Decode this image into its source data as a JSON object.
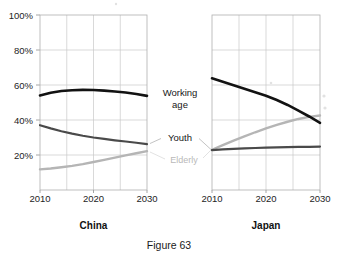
{
  "caption": "Figure 63",
  "axis": {
    "y_ticks": [
      "100%",
      "80%",
      "60%",
      "40%",
      "20%"
    ],
    "y_tick_values": [
      100,
      80,
      60,
      40,
      20
    ],
    "x_ticks": [
      "2010",
      "2020",
      "2030"
    ],
    "x_tick_values": [
      2010,
      2020,
      2030
    ]
  },
  "annotations": {
    "working_age": "Working age",
    "working_age_line1": "Working",
    "working_age_line2": "age",
    "youth": "Youth",
    "elderly": "Elderly"
  },
  "panels": {
    "left": {
      "title": "China"
    },
    "right": {
      "title": "Japan"
    }
  },
  "colors": {
    "working_age": "#121212",
    "youth": "#4a4a4a",
    "elderly": "#b5b5b5",
    "grid": "#c9c9c9",
    "frame": "#b0b0b0",
    "background": "#ffffff"
  },
  "chart_data": [
    {
      "type": "line",
      "title": "China",
      "xlabel": "",
      "ylabel": "",
      "xlim": [
        2010,
        2030
      ],
      "ylim": [
        0,
        100
      ],
      "grid": true,
      "legend": "inline-annotations",
      "x": [
        2010,
        2012,
        2014,
        2016,
        2018,
        2020,
        2022,
        2024,
        2026,
        2028,
        2030
      ],
      "series": [
        {
          "name": "Working age",
          "values": [
            54.0,
            55.6,
            56.6,
            57.0,
            57.2,
            57.1,
            56.8,
            56.3,
            55.7,
            54.9,
            53.8
          ]
        },
        {
          "name": "Youth",
          "values": [
            37.0,
            35.2,
            33.6,
            32.2,
            31.0,
            30.0,
            29.2,
            28.4,
            27.7,
            27.0,
            26.2
          ]
        },
        {
          "name": "Elderly",
          "values": [
            11.8,
            12.3,
            13.0,
            13.8,
            14.8,
            16.0,
            17.2,
            18.5,
            19.8,
            21.0,
            22.2
          ]
        }
      ]
    },
    {
      "type": "line",
      "title": "Japan",
      "xlabel": "",
      "ylabel": "",
      "xlim": [
        2010,
        2030
      ],
      "ylim": [
        0,
        100
      ],
      "grid": true,
      "legend": "inline-annotations",
      "x": [
        2010,
        2012,
        2014,
        2016,
        2018,
        2020,
        2022,
        2024,
        2026,
        2028,
        2030
      ],
      "series": [
        {
          "name": "Working age",
          "values": [
            63.8,
            61.8,
            59.8,
            57.8,
            55.8,
            53.8,
            51.4,
            48.6,
            45.4,
            42.0,
            38.4
          ]
        },
        {
          "name": "Youth",
          "values": [
            22.8,
            23.2,
            23.5,
            23.8,
            24.0,
            24.2,
            24.4,
            24.5,
            24.6,
            24.7,
            24.8
          ]
        },
        {
          "name": "Elderly",
          "values": [
            23.0,
            25.6,
            28.2,
            30.6,
            33.0,
            35.2,
            37.2,
            39.0,
            40.6,
            41.8,
            42.6
          ]
        }
      ]
    }
  ]
}
